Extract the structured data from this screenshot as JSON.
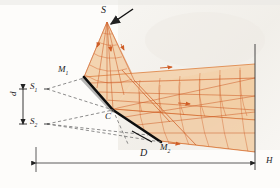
{
  "figure": {
    "type": "optics-ray-diagram",
    "background_color": "#fdfcfa",
    "beam_color": "#e8a76a",
    "beam_fill": "#f3d2ae",
    "ray_color": "#d4622a",
    "dashed_color": "#6e6e6e",
    "mirror_color": "#111111",
    "label_color": "#1a1a1a"
  },
  "labels": {
    "source": "S",
    "virtual_source_1": "S",
    "virtual_source_1_sub": "1",
    "virtual_source_2": "S",
    "virtual_source_2_sub": "2",
    "mirror_1": "M",
    "mirror_1_sub": "1",
    "mirror_2": "M",
    "mirror_2_sub": "2",
    "vertex": "C",
    "separation": "d",
    "distance": "D",
    "screen": "H"
  },
  "caption": "",
  "geometry": {
    "source_point": [
      107,
      22
    ],
    "vertex_point": [
      113,
      110
    ],
    "mirror1_end": [
      84,
      78
    ],
    "mirror2_end": [
      160,
      141
    ],
    "screen_x": 255,
    "virtual_source_1_point": [
      38,
      89
    ],
    "virtual_source_2_point": [
      38,
      124
    ],
    "dimension_line_y": 163,
    "dimension_left_x": 36,
    "dimension_right_x": 255
  }
}
